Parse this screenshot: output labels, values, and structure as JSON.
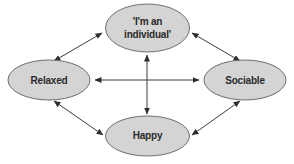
{
  "diagram": {
    "type": "relationship-diagram",
    "colors": {
      "node_fill": "#d4d4d4",
      "node_stroke": "#6e6e6e",
      "arrow": "#3c3c3c",
      "text": "#2a2a2a",
      "background": "#ffffff"
    },
    "nodes": [
      {
        "id": "individual",
        "label_line1": "'I'm an",
        "label_line2": "individual'"
      },
      {
        "id": "relaxed",
        "label": "Relaxed"
      },
      {
        "id": "sociable",
        "label": "Sociable"
      },
      {
        "id": "happy",
        "label": "Happy"
      }
    ],
    "edges": [
      {
        "from": "individual",
        "to": "relaxed",
        "direction": "bidirectional"
      },
      {
        "from": "individual",
        "to": "sociable",
        "direction": "bidirectional"
      },
      {
        "from": "relaxed",
        "to": "happy",
        "direction": "bidirectional"
      },
      {
        "from": "sociable",
        "to": "happy",
        "direction": "bidirectional"
      },
      {
        "from": "relaxed",
        "to": "sociable",
        "direction": "bidirectional"
      },
      {
        "from": "individual",
        "to": "happy",
        "direction": "bidirectional"
      }
    ]
  }
}
